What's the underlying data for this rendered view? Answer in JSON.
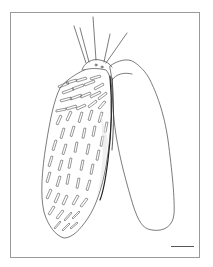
{
  "figure": {
    "type": "scientific line illustration",
    "frame": {
      "x": 10,
      "y": 12,
      "width": 190,
      "height": 246,
      "color": "#9a9a9a"
    },
    "scale_bar": {
      "x": 171,
      "y": 246,
      "length": 23,
      "color": "#555555"
    },
    "line_color": "#444444",
    "apical_setae_count": 5
  }
}
